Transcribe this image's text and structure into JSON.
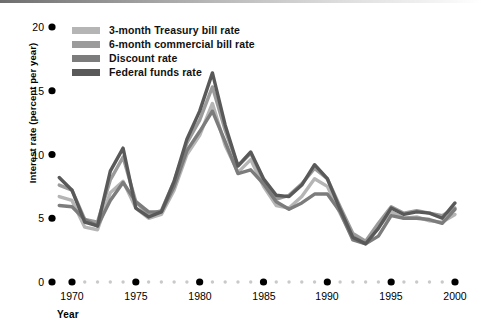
{
  "chart_data": {
    "type": "line",
    "title": "",
    "xlabel": "Year",
    "ylabel": "Interest rate (percent per year)",
    "xlim": [
      1969,
      2000
    ],
    "ylim": [
      0,
      20
    ],
    "grid": false,
    "legend_position": "top-left inside axes",
    "y_ticks": [
      0,
      5,
      10,
      15,
      20
    ],
    "y_tick_labels": [
      "0",
      "5",
      "10",
      "15",
      "20"
    ],
    "x_major_ticks": [
      1970,
      1975,
      1980,
      1985,
      1990,
      1995,
      2000
    ],
    "x_major_tick_labels": [
      "1970",
      "1975",
      "1980",
      "1985",
      "1990",
      "1995",
      "2000"
    ],
    "x_minor_ticks": [
      1971,
      1972,
      1973,
      1974,
      1976,
      1977,
      1978,
      1979,
      1981,
      1982,
      1983,
      1984,
      1986,
      1987,
      1988,
      1989,
      1991,
      1992,
      1993,
      1994,
      1996,
      1997,
      1998,
      1999
    ],
    "x": [
      1969,
      1970,
      1971,
      1972,
      1973,
      1974,
      1975,
      1976,
      1977,
      1978,
      1979,
      1980,
      1981,
      1982,
      1983,
      1984,
      1985,
      1986,
      1987,
      1988,
      1989,
      1990,
      1991,
      1992,
      1993,
      1994,
      1995,
      1996,
      1997,
      1998,
      1999,
      2000
    ],
    "series": [
      {
        "name": "3-month Treasury bill rate",
        "color": "#b5b5b5",
        "values": [
          6.7,
          6.4,
          4.3,
          4.1,
          7.0,
          7.9,
          5.8,
          5.0,
          5.3,
          7.2,
          10.0,
          11.5,
          14.0,
          10.7,
          8.6,
          9.6,
          7.5,
          6.0,
          5.8,
          6.7,
          8.1,
          7.5,
          5.4,
          3.4,
          3.0,
          4.3,
          5.5,
          5.0,
          5.1,
          4.8,
          4.7,
          5.3
        ]
      },
      {
        "name": "6-month commercial bill rate",
        "color": "#9b9b9b",
        "values": [
          7.6,
          7.2,
          4.9,
          4.7,
          8.0,
          9.8,
          6.3,
          5.3,
          5.6,
          7.9,
          10.9,
          12.7,
          15.3,
          11.9,
          9.1,
          10.1,
          8.0,
          6.5,
          6.8,
          7.7,
          8.9,
          8.1,
          5.9,
          3.8,
          3.2,
          4.6,
          5.9,
          5.4,
          5.6,
          5.4,
          5.2,
          5.8
        ]
      },
      {
        "name": "Discount rate",
        "color": "#7c7c7c",
        "values": [
          6.0,
          5.9,
          4.9,
          4.4,
          6.4,
          7.8,
          6.3,
          5.5,
          5.5,
          7.5,
          10.3,
          11.8,
          13.4,
          11.0,
          8.5,
          8.8,
          7.7,
          6.3,
          5.7,
          6.2,
          6.9,
          6.9,
          5.5,
          3.3,
          3.0,
          3.6,
          5.2,
          5.0,
          5.0,
          4.9,
          4.6,
          5.7
        ]
      },
      {
        "name": "Federal funds rate",
        "color": "#595959",
        "values": [
          8.2,
          7.2,
          4.7,
          4.4,
          8.7,
          10.5,
          5.8,
          5.1,
          5.5,
          7.9,
          11.2,
          13.4,
          16.4,
          12.3,
          9.1,
          10.2,
          8.1,
          6.8,
          6.7,
          7.6,
          9.2,
          8.1,
          5.7,
          3.5,
          3.0,
          4.2,
          5.8,
          5.3,
          5.5,
          5.4,
          5.0,
          6.2
        ]
      }
    ]
  },
  "legend": {
    "items": [
      {
        "label": "3-month Treasury bill rate",
        "color": "#b5b5b5"
      },
      {
        "label": "6-month commercial bill rate",
        "color": "#9b9b9b"
      },
      {
        "label": "Discount rate",
        "color": "#7c7c7c"
      },
      {
        "label": "Federal funds rate",
        "color": "#595959"
      }
    ]
  },
  "axes": {
    "y_title": "Interest rate (percent per year)",
    "x_title": "Year",
    "y_tick_labels": [
      "20",
      "15",
      "10",
      "5",
      "0"
    ],
    "x_tick_labels": [
      "1970",
      "1975",
      "1980",
      "1985",
      "1990",
      "1995",
      "2000"
    ]
  },
  "style": {
    "tick_dot_color": "#000000",
    "minor_dot_color": "#c9c9c9",
    "background": "#ffffff"
  }
}
